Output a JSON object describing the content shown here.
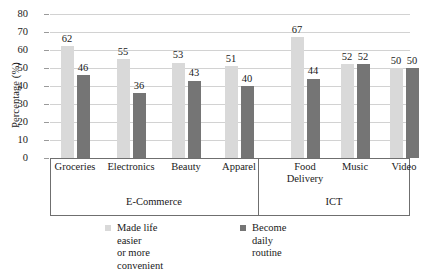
{
  "chart_data": {
    "type": "bar",
    "title": "",
    "xlabel": "",
    "ylabel": "Percentage (%)",
    "ylim": [
      0,
      80
    ],
    "ytick_step": 10,
    "yticks": [
      "80",
      "70",
      "60",
      "50",
      "40",
      "30",
      "20",
      "10",
      "0"
    ],
    "grid": true,
    "legend_position": "bottom",
    "categories": [
      "Groceries",
      "Electronics",
      "Beauty",
      "Apparel",
      "Food\nDelivery",
      "Music",
      "Video"
    ],
    "groups": [
      {
        "label": "E-Commerce",
        "categories": [
          "Groceries",
          "Electronics",
          "Beauty",
          "Apparel"
        ]
      },
      {
        "label": "ICT",
        "categories": [
          "Food Delivery",
          "Music",
          "Video"
        ]
      }
    ],
    "series": [
      {
        "name": "Made life easier\nor more convenient",
        "color": "#d9d9d9",
        "values": [
          62,
          55,
          53,
          51,
          67,
          52,
          50
        ]
      },
      {
        "name": "Become daily routine",
        "color": "#757575",
        "values": [
          46,
          36,
          43,
          40,
          44,
          52,
          50
        ]
      }
    ]
  }
}
